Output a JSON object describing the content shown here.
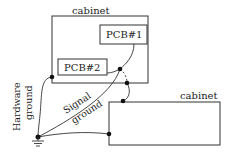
{
  "diagram": {
    "colors": {
      "stroke": "#333333",
      "background": "#ffffff",
      "text": "#222222"
    },
    "cabinets": [
      {
        "id": "cabinet-1",
        "label": "cabinet"
      },
      {
        "id": "cabinet-2",
        "label": "cabinet"
      }
    ],
    "pcbs": [
      {
        "id": "pcb-1",
        "label": "PCB#1"
      },
      {
        "id": "pcb-2",
        "label": "PCB#2"
      }
    ],
    "labels": {
      "hardware_ground_line1": "Hardware",
      "hardware_ground_line2": "ground",
      "signal_ground_line1": "Signal",
      "signal_ground_line2": "ground"
    },
    "icons": {
      "ground_symbol": "earth-ground-icon",
      "junction_dot": "junction-dot-icon"
    }
  }
}
